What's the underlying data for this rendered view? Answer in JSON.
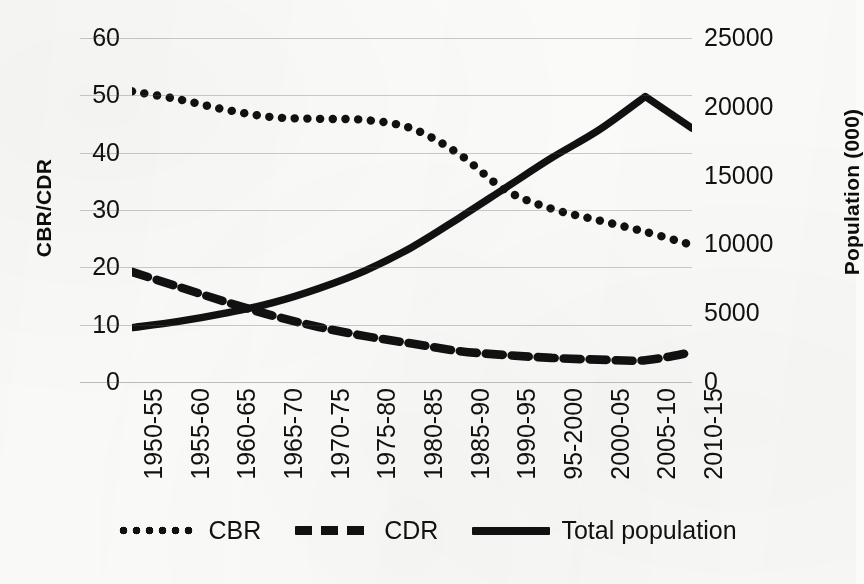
{
  "chart_data": {
    "type": "line",
    "title": "",
    "xlabel": "",
    "categories": [
      "1950-55",
      "1955-60",
      "1960-65",
      "1965-70",
      "1970-75",
      "1975-80",
      "1980-85",
      "1985-90",
      "1990-95",
      "95-2000",
      "2000-05",
      "2005-10",
      "2010-15"
    ],
    "axes": {
      "left": {
        "label": "CBR/CDR",
        "ticks": [
          "0",
          "10",
          "20",
          "30",
          "40",
          "50",
          "60"
        ],
        "values": [
          0,
          10,
          20,
          30,
          40,
          50,
          60
        ],
        "min": 0,
        "max": 60
      },
      "right": {
        "label": "Population (000)",
        "ticks": [
          "0",
          "5000",
          "10000",
          "15000",
          "20000",
          "25000"
        ],
        "values": [
          0,
          5000,
          10000,
          15000,
          20000,
          25000
        ],
        "min": 0,
        "max": 25000
      }
    },
    "grid": true,
    "legend_position": "bottom",
    "series": [
      {
        "name": "CBR",
        "axis": "left",
        "style": "dotted",
        "color": "#111111",
        "values": [
          50.7,
          49.3,
          47.5,
          46.2,
          45.9,
          45.7,
          44.2,
          39.8,
          33.5,
          30.2,
          28.2,
          26.2,
          23.9
        ]
      },
      {
        "name": "CDR",
        "axis": "left",
        "style": "dashed",
        "color": "#111111",
        "values": [
          19.2,
          16.6,
          14.0,
          11.6,
          9.6,
          8.0,
          6.7,
          5.4,
          4.7,
          4.2,
          3.9,
          3.8,
          5.2
        ]
      },
      {
        "name": "Total population",
        "axis": "right",
        "style": "solid",
        "color": "#111111",
        "values": [
          3950,
          4400,
          5000,
          5750,
          6800,
          8100,
          9800,
          11900,
          14100,
          16300,
          18300,
          20750,
          18450
        ]
      }
    ],
    "legend": [
      {
        "label": "CBR",
        "style": "dotted"
      },
      {
        "label": "CDR",
        "style": "dashed"
      },
      {
        "label": "Total population",
        "style": "solid"
      }
    ]
  }
}
